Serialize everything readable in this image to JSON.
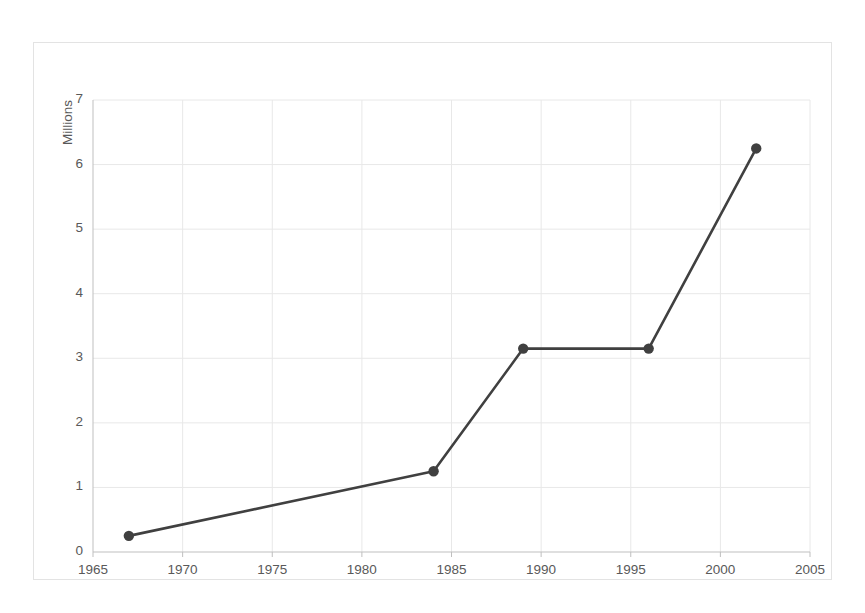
{
  "chart_data": {
    "type": "line",
    "title": "",
    "subtitle": "",
    "xlabel": "",
    "ylabel": "Millions",
    "xlim": [
      1965,
      2005
    ],
    "ylim": [
      0,
      7
    ],
    "grid": true,
    "legend": false,
    "legend_position": "none",
    "marker": "circle",
    "line_color": "#404040",
    "marker_color": "#404040",
    "grid_color": "#e8e8e8",
    "axis_color": "#bfbfbf",
    "text_color": "#595959",
    "background_color": "#ffffff",
    "x_ticks": [
      1965,
      1970,
      1975,
      1980,
      1985,
      1990,
      1995,
      2000,
      2005
    ],
    "y_ticks": [
      0,
      1,
      2,
      3,
      4,
      5,
      6,
      7
    ],
    "x": [
      1967,
      1984,
      1989,
      1996,
      2002
    ],
    "values": [
      0.25,
      1.25,
      3.15,
      3.15,
      6.25
    ],
    "series": [
      {
        "name": "Millions",
        "points": [
          {
            "x": 1967,
            "y": 0.25
          },
          {
            "x": 1984,
            "y": 1.25
          },
          {
            "x": 1989,
            "y": 3.15
          },
          {
            "x": 1996,
            "y": 3.15
          },
          {
            "x": 2002,
            "y": 6.25
          }
        ]
      }
    ]
  },
  "axis": {
    "y_title": "Millions",
    "y_tick_labels": [
      "7",
      "6",
      "5",
      "4",
      "3",
      "2",
      "1",
      "0"
    ],
    "x_tick_labels": [
      "1965",
      "1970",
      "1975",
      "1980",
      "1985",
      "1990",
      "1995",
      "2000",
      "2005"
    ]
  }
}
